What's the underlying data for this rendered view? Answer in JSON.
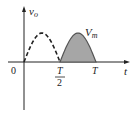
{
  "diagram": {
    "y_axis_label": "v",
    "y_axis_subscript": "o",
    "x_axis_label": "t",
    "peak_label": "V",
    "peak_subscript": "m",
    "ticks": {
      "origin": "0",
      "half_period_num": "T",
      "half_period_den": "2",
      "period": "T"
    },
    "segments": [
      {
        "name": "first-half-cycle",
        "from": "0",
        "to": "T/2",
        "style": "dashed",
        "shaded": false
      },
      {
        "name": "second-half-cycle",
        "from": "T/2",
        "to": "T",
        "style": "solid",
        "shaded": true
      }
    ],
    "colors": {
      "axis": "#222222",
      "curve": "#222222",
      "fill": "#a6a6a6",
      "fill_stroke": "#555555"
    }
  }
}
